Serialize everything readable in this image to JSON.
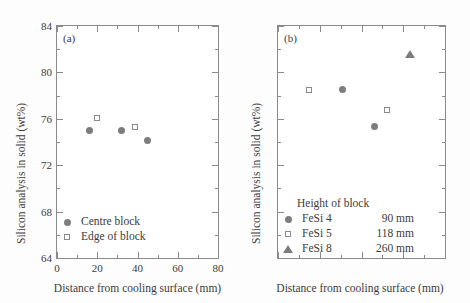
{
  "figure": {
    "panels": [
      {
        "tag": "(a)",
        "legend_items": [
          {
            "marker": "filled-circle-marker",
            "label": "Centre block"
          },
          {
            "marker": "open-square-marker",
            "label": "Edge of block"
          }
        ]
      },
      {
        "tag": "(b)",
        "legend_title": "Height of block",
        "legend_items": [
          {
            "marker": "filled-circle-marker",
            "label": "FeSi 4",
            "value": "90 mm"
          },
          {
            "marker": "open-square-marker",
            "label": "FeSi 5",
            "value": "118 mm"
          },
          {
            "marker": "filled-triangle-marker",
            "label": "FeSi 8",
            "value": "260 mm"
          }
        ]
      }
    ]
  },
  "axes": {
    "xlabel": "Distance from cooling surface (mm)",
    "ylabel": "Silicon analysis in solid (wt%)",
    "xticks": [
      "0",
      "20",
      "40",
      "60",
      "80"
    ],
    "yticks": [
      "64",
      "68",
      "72",
      "76",
      "80",
      "84"
    ]
  },
  "colors": {
    "marker_fill": "#7d7d7d",
    "marker_edge": "#8a8a8a",
    "axis": "#8a8a8a",
    "text": "#3c3c3c",
    "background": "#ffffff"
  },
  "chart_data": [
    {
      "type": "scatter",
      "title": "(a)",
      "xlabel": "Distance from cooling surface (mm)",
      "ylabel": "Silicon analysis in solid (wt%)",
      "xlim": [
        0,
        80
      ],
      "ylim": [
        64,
        84
      ],
      "xticks": [
        0,
        20,
        40,
        60,
        80
      ],
      "yticks": [
        64,
        68,
        72,
        76,
        80,
        84
      ],
      "grid": false,
      "legend_position": "lower-left",
      "series": [
        {
          "name": "Centre block",
          "marker": "filled-circle",
          "x": [
            16,
            32,
            45
          ],
          "y": [
            75.0,
            75.0,
            74.1
          ]
        },
        {
          "name": "Edge of block",
          "marker": "open-square",
          "x": [
            20,
            39
          ],
          "y": [
            76.1,
            75.3
          ]
        }
      ]
    },
    {
      "type": "scatter",
      "title": "(b)",
      "xlabel": "Distance from cooling surface (mm)",
      "ylabel": "Silicon analysis in solid (wt%)",
      "xlim": [
        0,
        80
      ],
      "ylim": [
        64,
        84
      ],
      "xticks": [
        0,
        20,
        40,
        60,
        80
      ],
      "yticks": [
        64,
        68,
        72,
        76,
        80,
        84
      ],
      "grid": false,
      "legend_position": "lower-center",
      "legend_title": "Height of block",
      "series": [
        {
          "name": "FeSi 4",
          "height_of_block": "90 mm",
          "marker": "filled-circle",
          "x": [
            31,
            46
          ],
          "y": [
            78.5,
            75.3
          ]
        },
        {
          "name": "FeSi 5",
          "height_of_block": "118 mm",
          "marker": "open-square",
          "x": [
            15,
            52
          ],
          "y": [
            78.5,
            76.8
          ]
        },
        {
          "name": "FeSi 8",
          "height_of_block": "260 mm",
          "marker": "filled-triangle",
          "x": [
            63
          ],
          "y": [
            81.6
          ]
        }
      ]
    }
  ]
}
